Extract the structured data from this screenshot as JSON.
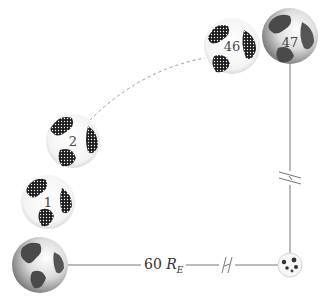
{
  "diagram": {
    "distance_label": {
      "value": "60",
      "symbol": "R",
      "subscript": "E"
    },
    "earths": [
      {
        "id": "earth",
        "label": "",
        "style": "shaded"
      },
      {
        "id": "1",
        "label": "1",
        "style": "sketched"
      },
      {
        "id": "2",
        "label": "2",
        "style": "sketched"
      },
      {
        "id": "46",
        "label": "46",
        "style": "sketched"
      },
      {
        "id": "47",
        "label": "47",
        "style": "shaded"
      }
    ],
    "moon": {
      "label": ""
    },
    "colors": {
      "line": "#777777",
      "globe_dark": "#2a2a2a",
      "globe_light": "#f2f2f2"
    }
  }
}
